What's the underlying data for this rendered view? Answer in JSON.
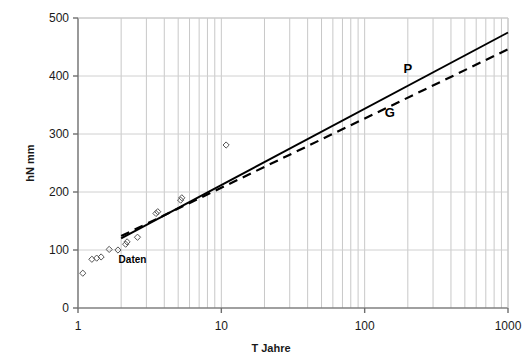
{
  "chart_data": {
    "type": "scatter",
    "title": "",
    "xlabel": "T  Jahre",
    "ylabel": "hN  mm",
    "xscale": "log",
    "yscale": "linear",
    "xlim": [
      1,
      1000
    ],
    "ylim": [
      0,
      500
    ],
    "xticks": [
      "1",
      "10",
      "100",
      "1000"
    ],
    "xtick_values": [
      1,
      10,
      100,
      1000
    ],
    "yticks": [
      "0",
      "100",
      "200",
      "300",
      "400",
      "500"
    ],
    "ytick_values": [
      0,
      100,
      200,
      300,
      400,
      500
    ],
    "grid": "vertical minor log gridlines and horizontal major gridlines",
    "legend_position": "inline annotations on curves",
    "series": [
      {
        "name": "Daten",
        "label": "Daten",
        "type": "scatter",
        "marker": "open-diamond",
        "color": "#555555",
        "points": [
          {
            "x": 1.08,
            "y": 60
          },
          {
            "x": 1.25,
            "y": 84
          },
          {
            "x": 1.35,
            "y": 86
          },
          {
            "x": 1.45,
            "y": 88
          },
          {
            "x": 1.65,
            "y": 101
          },
          {
            "x": 1.9,
            "y": 100
          },
          {
            "x": 2.15,
            "y": 110
          },
          {
            "x": 2.2,
            "y": 114
          },
          {
            "x": 2.6,
            "y": 122
          },
          {
            "x": 3.5,
            "y": 163
          },
          {
            "x": 3.6,
            "y": 166
          },
          {
            "x": 5.2,
            "y": 186
          },
          {
            "x": 5.3,
            "y": 190
          },
          {
            "x": 10.8,
            "y": 281
          }
        ]
      },
      {
        "name": "P",
        "label": "P",
        "type": "line",
        "style": "solid",
        "color": "#000000",
        "points": [
          {
            "x": 2.0,
            "y": 120
          },
          {
            "x": 1000,
            "y": 475
          }
        ]
      },
      {
        "name": "G",
        "label": "G",
        "type": "line",
        "style": "dashed",
        "color": "#000000",
        "points": [
          {
            "x": 2.0,
            "y": 124
          },
          {
            "x": 1000,
            "y": 446
          }
        ]
      }
    ],
    "annotations": [
      {
        "text": "P",
        "x": 200,
        "y": 405
      },
      {
        "text": "G",
        "x": 150,
        "y": 330
      },
      {
        "text": "Daten",
        "x": 2.4,
        "y": 78
      }
    ]
  },
  "axes": {
    "x_title": "T  Jahre",
    "y_title": "hN  mm"
  }
}
